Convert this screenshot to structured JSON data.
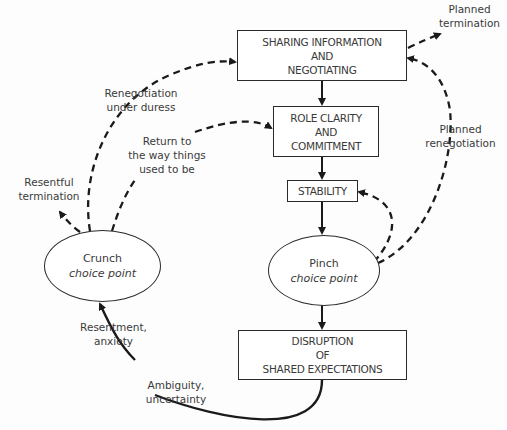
{
  "diagram": {
    "nodes": {
      "sharing": {
        "lines": [
          "SHARING INFORMATION",
          "AND",
          "NEGOTIATING"
        ]
      },
      "role": {
        "lines": [
          "ROLE CLARITY",
          "AND",
          "COMMITMENT"
        ]
      },
      "stability": {
        "lines": [
          "STABILITY"
        ]
      },
      "pinch": {
        "title": "Pinch",
        "subtitle": "choice point"
      },
      "crunch": {
        "title": "Crunch",
        "subtitle": "choice point"
      },
      "disruption": {
        "lines": [
          "DISRUPTION",
          "OF",
          "SHARED EXPECTATIONS"
        ]
      }
    },
    "edge_labels": {
      "planned_termination": [
        "Planned",
        "termination"
      ],
      "planned_renegotiation": [
        "Planned",
        "renegotiation"
      ],
      "renegotiation_under_duress": [
        "Renegotiation",
        "under duress"
      ],
      "return_to_way": [
        "Return to",
        "the way things",
        "used to be"
      ],
      "resentful_termination": [
        "Resentful",
        "termination"
      ],
      "resentment_anxiety": [
        "Resentment,",
        "anxiety"
      ],
      "ambiguity_uncertainty": [
        "Ambiguity,",
        "uncertainty"
      ]
    },
    "colors": {
      "line": "#1a1a1a",
      "text": "#3a3a3a",
      "background": "#fdfdfd"
    }
  }
}
